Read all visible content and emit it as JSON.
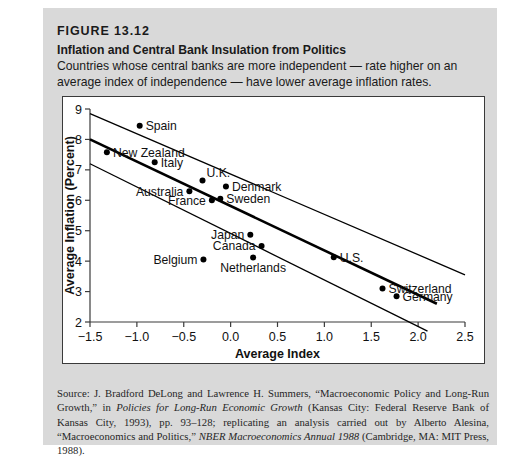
{
  "figure": {
    "number": "FIGURE 13.12",
    "title": "Inflation and Central Bank Insulation from Politics",
    "subtitle": "Countries whose central banks are more independent — rate higher on an average index of independence — have lower average inflation rates."
  },
  "source": {
    "prefix": "Source: J. Bradford DeLong and Lawrence H. Summers, “Macroeconomic Policy and Long-Run Growth,” in ",
    "italic1": "Policies for Long-Run Economic Growth",
    "mid1": " (Kansas City: Federal Reserve Bank of Kansas City, 1993), pp. 93–128; replicating an analysis carried out by Alberto Alesina, “Macroeconomics and Politics,” ",
    "italic2": "NBER Macroeconomics Annual 1988",
    "mid2": " (Cambridge, MA: MIT Press, 1988)."
  },
  "colors": {
    "panel": "#d9d9d9",
    "plot_background": "#ffffff",
    "axis": "#3a3a3a",
    "point": "#000000",
    "regression_line": "#000000",
    "band_line": "#000000"
  },
  "chart_data": {
    "type": "scatter",
    "title": "Inflation and Central Bank Insulation from Politics",
    "xlabel": "Average Index",
    "ylabel": "Average Inflation (Percent)",
    "xlim": [
      -1.5,
      2.5
    ],
    "ylim": [
      2,
      9
    ],
    "xticks": [
      -1.5,
      -1.0,
      -0.5,
      0.0,
      0.5,
      1.0,
      1.5,
      2.0,
      2.5
    ],
    "xtick_labels": [
      "−1.5",
      "−1.0",
      "−0.5",
      "0.0",
      "0.5",
      "1.0",
      "1.5",
      "2.0",
      "2.5"
    ],
    "yticks": [
      2,
      3,
      4,
      5,
      6,
      7,
      8,
      9
    ],
    "ytick_labels": [
      "2",
      "3",
      "4",
      "5",
      "6",
      "7",
      "8",
      "9"
    ],
    "grid": false,
    "legend": false,
    "points": [
      {
        "label": "Spain",
        "x": -0.97,
        "y": 8.45,
        "label_pos": "right"
      },
      {
        "label": "New Zealand",
        "x": -1.32,
        "y": 7.58,
        "label_pos": "right"
      },
      {
        "label": "Italy",
        "x": -0.81,
        "y": 7.25,
        "label_pos": "right"
      },
      {
        "label": "U.K.",
        "x": -0.3,
        "y": 6.65,
        "label_pos": "above-right"
      },
      {
        "label": "Denmark",
        "x": -0.05,
        "y": 6.45,
        "label_pos": "right"
      },
      {
        "label": "Australia",
        "x": -0.44,
        "y": 6.3,
        "label_pos": "left"
      },
      {
        "label": "Sweden",
        "x": -0.11,
        "y": 6.05,
        "label_pos": "right"
      },
      {
        "label": "France",
        "x": -0.2,
        "y": 6.0,
        "label_pos": "left"
      },
      {
        "label": "Japan",
        "x": 0.21,
        "y": 4.87,
        "label_pos": "left"
      },
      {
        "label": "Canada",
        "x": 0.33,
        "y": 4.5,
        "label_pos": "left"
      },
      {
        "label": "Belgium",
        "x": -0.29,
        "y": 4.05,
        "label_pos": "left"
      },
      {
        "label": "Netherlands",
        "x": 0.24,
        "y": 4.12,
        "label_pos": "below"
      },
      {
        "label": "U.S.",
        "x": 1.1,
        "y": 4.13,
        "label_pos": "right"
      },
      {
        "label": "Switzerland",
        "x": 1.62,
        "y": 3.1,
        "label_pos": "right"
      },
      {
        "label": "Germany",
        "x": 1.77,
        "y": 2.85,
        "label_pos": "right"
      }
    ],
    "lines": [
      {
        "name": "upper-band",
        "x0": -1.5,
        "y0": 8.85,
        "x1": 2.5,
        "y1": 3.55,
        "width": 1.3
      },
      {
        "name": "regression-line",
        "x0": -1.5,
        "y0": 8.0,
        "x1": 2.2,
        "y1": 2.6,
        "width": 2.6
      },
      {
        "name": "lower-band",
        "x0": -1.5,
        "y0": 7.2,
        "x1": 2.1,
        "y1": 1.7,
        "width": 1.3
      }
    ]
  }
}
